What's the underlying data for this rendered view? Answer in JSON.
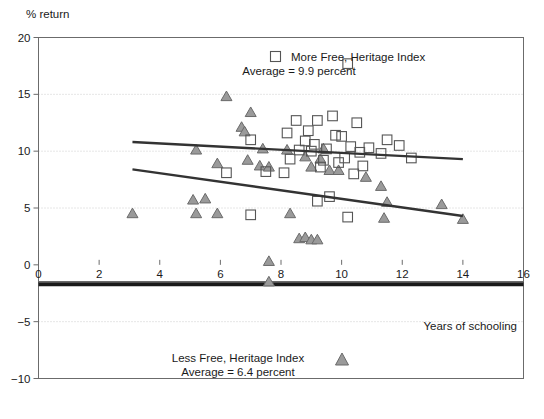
{
  "chart_data": {
    "type": "scatter",
    "title": "",
    "ylabel": "% return",
    "xlabel": "Years of schooling",
    "xlim": [
      0,
      16
    ],
    "ylim": [
      -10,
      20
    ],
    "xticks": [
      "0",
      "2",
      "4",
      "6",
      "8",
      "10",
      "12",
      "14",
      "16"
    ],
    "xtick_values": [
      0,
      2,
      4,
      6,
      8,
      10,
      12,
      14,
      16
    ],
    "yticks": [
      "20",
      "15",
      "10",
      "5",
      "0",
      "−5",
      "−10"
    ],
    "ytick_values": [
      20,
      15,
      10,
      5,
      0,
      -5,
      -10
    ],
    "grid": "horizontal-dotted",
    "legend_position": "inside-top-center and inside-bottom-center",
    "series": [
      {
        "name": "More Free, Heritage Index",
        "marker": "open-square",
        "average_label": "Average = 9.9 percent",
        "average": 9.9,
        "points": [
          [
            10.2,
            17.7
          ],
          [
            8.5,
            12.7
          ],
          [
            9.2,
            12.7
          ],
          [
            10.5,
            12.5
          ],
          [
            8.9,
            11.8
          ],
          [
            8.2,
            11.6
          ],
          [
            7.0,
            11.0
          ],
          [
            9.7,
            13.1
          ],
          [
            9.8,
            11.4
          ],
          [
            10.0,
            11.3
          ],
          [
            11.5,
            11.0
          ],
          [
            8.8,
            10.9
          ],
          [
            9.1,
            10.6
          ],
          [
            10.3,
            10.4
          ],
          [
            10.9,
            10.3
          ],
          [
            11.9,
            10.5
          ],
          [
            9.5,
            10.2
          ],
          [
            8.6,
            10.1
          ],
          [
            9.0,
            10.0
          ],
          [
            10.6,
            9.9
          ],
          [
            11.3,
            9.8
          ],
          [
            12.3,
            9.4
          ],
          [
            9.4,
            9.2
          ],
          [
            10.1,
            9.4
          ],
          [
            8.3,
            9.3
          ],
          [
            6.2,
            8.1
          ],
          [
            7.5,
            8.2
          ],
          [
            8.1,
            8.1
          ],
          [
            9.9,
            9.0
          ],
          [
            10.7,
            8.7
          ],
          [
            9.3,
            8.6
          ],
          [
            10.4,
            8.0
          ],
          [
            9.6,
            6.0
          ],
          [
            10.2,
            4.2
          ],
          [
            7.0,
            4.4
          ],
          [
            9.2,
            5.6
          ]
        ]
      },
      {
        "name": "Less Free, Heritage Index",
        "marker": "filled-triangle",
        "average_label": "Average = 6.4 percent",
        "average": 6.4,
        "points": [
          [
            6.2,
            14.8
          ],
          [
            7.0,
            13.4
          ],
          [
            6.7,
            12.1
          ],
          [
            6.8,
            11.7
          ],
          [
            5.2,
            10.1
          ],
          [
            7.4,
            10.2
          ],
          [
            8.2,
            10.1
          ],
          [
            9.4,
            10.2
          ],
          [
            8.8,
            9.5
          ],
          [
            9.3,
            9.3
          ],
          [
            5.9,
            8.9
          ],
          [
            6.9,
            9.2
          ],
          [
            7.3,
            8.7
          ],
          [
            7.6,
            8.6
          ],
          [
            9.0,
            8.6
          ],
          [
            9.6,
            8.3
          ],
          [
            9.9,
            8.3
          ],
          [
            10.8,
            7.7
          ],
          [
            11.3,
            6.9
          ],
          [
            11.5,
            5.5
          ],
          [
            13.3,
            5.3
          ],
          [
            14.0,
            4.0
          ],
          [
            11.4,
            4.1
          ],
          [
            3.1,
            4.5
          ],
          [
            5.1,
            5.7
          ],
          [
            5.5,
            5.8
          ],
          [
            5.2,
            4.5
          ],
          [
            5.9,
            4.5
          ],
          [
            8.3,
            4.5
          ],
          [
            8.6,
            2.3
          ],
          [
            8.8,
            2.4
          ],
          [
            9.0,
            2.2
          ],
          [
            9.2,
            2.2
          ],
          [
            7.6,
            0.3
          ],
          [
            7.6,
            -1.5
          ]
        ]
      }
    ],
    "trendlines": [
      {
        "name": "more-free-trend",
        "x1": 3.1,
        "y1": 10.8,
        "x2": 14.0,
        "y2": 9.3
      },
      {
        "name": "less-free-trend",
        "x1": 3.1,
        "y1": 8.4,
        "x2": 14.0,
        "y2": 4.3
      }
    ],
    "reference_line": {
      "name": "thick-baseline",
      "y": -1.7,
      "x1": 0,
      "x2": 16
    }
  },
  "labels": {
    "y_axis_title": "% return",
    "x_axis_title": "Years of schooling"
  },
  "legend_top": {
    "line1": "More Free, Heritage Index",
    "line2": "Average = 9.9 percent",
    "marker": "open-square-marker"
  },
  "legend_bottom": {
    "line1": "Less Free, Heritage Index",
    "line2": "Average = 6.4 percent",
    "marker": "filled-triangle-marker"
  }
}
